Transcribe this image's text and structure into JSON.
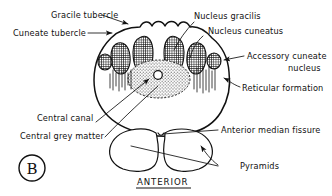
{
  "figure": {
    "panel_label": "B",
    "orientation_caption": "ANTERIOR",
    "ink_color": "#111111",
    "background_color": "#ffffff"
  },
  "labels": {
    "gracile_tubercle": "Gracile tubercle",
    "cuneate_tubercle": "Cuneate tubercle",
    "nucleus_gracilis": "Nucleus gracilis",
    "nucleus_cuneatus": "Nucleus cuneatus",
    "accessory_cuneate_nucleus_line1": "Accessory cuneate",
    "accessory_cuneate_nucleus_line2": "nucleus",
    "reticular_formation": "Reticular formation",
    "central_canal": "Central canal",
    "central_grey_matter": "Central grey matter",
    "anterior_median_fissure": "Anterior median fissure",
    "pyramids": "Pyramids"
  },
  "structures": [
    {
      "name": "gracile-tubercle",
      "label": "Gracile tubercle",
      "side": "posterior-left"
    },
    {
      "name": "cuneate-tubercle",
      "label": "Cuneate tubercle",
      "side": "posterior-left"
    },
    {
      "name": "nucleus-gracilis",
      "label": "Nucleus gracilis",
      "side": "posterior-midline"
    },
    {
      "name": "nucleus-cuneatus",
      "label": "Nucleus cuneatus",
      "side": "posterior-lateral"
    },
    {
      "name": "accessory-cuneate-nucleus",
      "label": "Accessory cuneate nucleus",
      "side": "lateral"
    },
    {
      "name": "reticular-formation",
      "label": "Reticular formation",
      "side": "lateral"
    },
    {
      "name": "central-canal",
      "label": "Central canal",
      "side": "central"
    },
    {
      "name": "central-grey-matter",
      "label": "Central grey matter",
      "side": "central"
    },
    {
      "name": "anterior-median-fissure",
      "label": "Anterior median fissure",
      "side": "anterior-midline"
    },
    {
      "name": "pyramids",
      "label": "Pyramids",
      "side": "anterior"
    }
  ]
}
